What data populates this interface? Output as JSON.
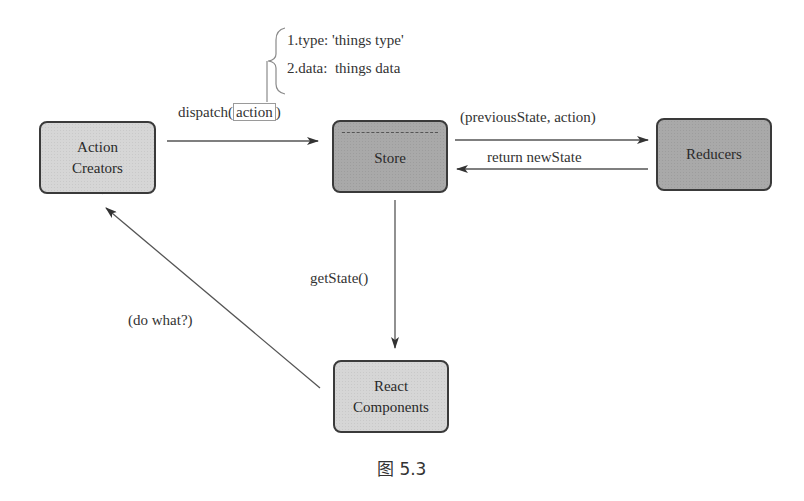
{
  "diagram": {
    "nodes": {
      "action_creators": {
        "line1": "Action",
        "line2": "Creators"
      },
      "store": {
        "label": "Store"
      },
      "reducers": {
        "label": "Reducers"
      },
      "react_components": {
        "line1": "React",
        "line2": "Components"
      }
    },
    "edges": {
      "dispatch": {
        "prefix": "dispatch(",
        "arg": "action",
        "suffix": ")",
        "from": "Action Creators",
        "to": "Store"
      },
      "action_shape": {
        "item1": "1.type: 'things type'",
        "item2": "2.data:  things data"
      },
      "to_reducers": {
        "label": "(previousState, action)",
        "from": "Store",
        "to": "Reducers"
      },
      "from_reducers": {
        "label": "return newState",
        "from": "Reducers",
        "to": "Store"
      },
      "get_state": {
        "label": "getState()",
        "from": "Store",
        "to": "React Components"
      },
      "do_what": {
        "label": "(do what?)",
        "from": "React Components",
        "to": "Action Creators"
      }
    },
    "caption": "图 5.3",
    "colors": {
      "light_node": "#d6d6d6",
      "dark_node": "#a9a9a9",
      "stroke": "#3a3a3a",
      "line": "#555555"
    }
  }
}
